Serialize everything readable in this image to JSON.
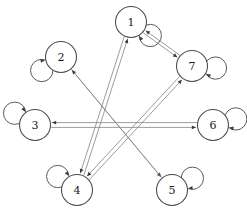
{
  "figure": {
    "type": "directed-graph",
    "background_color": "#ffffff",
    "node_stroke_color": "#4a4a4a",
    "edge_color": "#8a8a8a",
    "arrow_color": "#3a3a3a",
    "label_color": "#1a1a1a",
    "width": 247,
    "height": 220
  },
  "graph_data": {
    "type": "directed-graph",
    "node_count": 7,
    "nodes": [
      {
        "id": "1",
        "label": "1",
        "cx": 131,
        "cy": 22,
        "r": 15.5,
        "self_loop": true,
        "self_loop_angle": 35
      },
      {
        "id": "2",
        "label": "2",
        "cx": 61,
        "cy": 57,
        "r": 15.5,
        "self_loop": true,
        "self_loop_angle": 145
      },
      {
        "id": "3",
        "label": "3",
        "cx": 35,
        "cy": 125,
        "r": 15.5,
        "self_loop": true,
        "self_loop_angle": 210
      },
      {
        "id": "4",
        "label": "4",
        "cx": 77,
        "cy": 190,
        "r": 15.5,
        "self_loop": true,
        "self_loop_angle": 215
      },
      {
        "id": "5",
        "label": "5",
        "cx": 172,
        "cy": 190,
        "r": 15.5,
        "self_loop": true,
        "self_loop_angle": 330
      },
      {
        "id": "6",
        "label": "6",
        "cx": 213,
        "cy": 125,
        "r": 15.5,
        "self_loop": true,
        "self_loop_angle": 345
      },
      {
        "id": "7",
        "label": "7",
        "cx": 192,
        "cy": 66,
        "r": 15.5,
        "self_loop": true,
        "self_loop_angle": 5
      }
    ],
    "edges": [
      {
        "from": "1",
        "to": "7",
        "directed": true,
        "offset": 1.6
      },
      {
        "from": "7",
        "to": "1",
        "directed": true,
        "offset": 1.6
      },
      {
        "from": "3",
        "to": "6",
        "directed": true,
        "offset": 2.4
      },
      {
        "from": "6",
        "to": "3",
        "directed": true,
        "offset": 2.4
      },
      {
        "from": "1",
        "to": "4",
        "directed": true,
        "offset": 2.0
      },
      {
        "from": "4",
        "to": "1",
        "directed": true,
        "offset": 2.0
      },
      {
        "from": "4",
        "to": "7",
        "directed": true,
        "offset": 2.0
      },
      {
        "from": "7",
        "to": "4",
        "directed": true,
        "offset": 2.0
      },
      {
        "from": "2",
        "to": "5",
        "directed": true,
        "offset": 0
      },
      {
        "from": "5",
        "to": "2",
        "directed": true,
        "offset": 0
      }
    ],
    "self_loop_nodes": [
      "1",
      "2",
      "3",
      "4",
      "5",
      "6",
      "7"
    ],
    "legend": [],
    "annotations": []
  }
}
